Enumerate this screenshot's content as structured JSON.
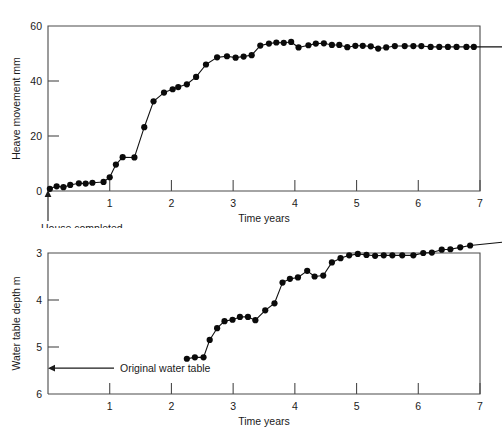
{
  "figure": {
    "background": "#ffffff",
    "line_color": "#111111",
    "marker_color": "#0a0a0a",
    "axis_color": "#4a4a4a"
  },
  "chart_data": [
    {
      "type": "line",
      "id": "heave-movement",
      "title": "",
      "xlabel": "Time years",
      "ylabel": "Heave movement mm",
      "xlim": [
        0,
        7
      ],
      "ylim": [
        0,
        60
      ],
      "xticks": [
        0,
        1,
        2,
        3,
        4,
        5,
        6,
        7
      ],
      "xtick_labels": [
        "",
        "1",
        "2",
        "3",
        "4",
        "5",
        "6",
        "7"
      ],
      "yticks": [
        0,
        20,
        40,
        60
      ],
      "ytick_labels": [
        "0",
        "20",
        "40",
        "60"
      ],
      "grid": false,
      "legend": "none",
      "markers": true,
      "annotations": [
        {
          "text": "House completed",
          "x": 0,
          "y": 0,
          "arrow": "up"
        }
      ],
      "x": [
        0.03,
        0.14,
        0.25,
        0.36,
        0.5,
        0.61,
        0.72,
        0.9,
        1.0,
        1.1,
        1.21,
        1.4,
        1.56,
        1.71,
        1.88,
        2.02,
        2.11,
        2.25,
        2.4,
        2.56,
        2.74,
        2.9,
        3.04,
        3.17,
        3.3,
        3.44,
        3.58,
        3.7,
        3.82,
        3.94,
        4.06,
        4.22,
        4.34,
        4.47,
        4.6,
        4.72,
        4.85,
        4.98,
        5.1,
        5.23,
        5.35,
        5.48,
        5.62,
        5.78,
        5.92,
        6.05,
        6.2,
        6.34,
        6.48,
        6.62,
        6.78,
        6.9
      ],
      "y": [
        0.8,
        1.7,
        1.4,
        2.2,
        2.8,
        2.7,
        3.0,
        3.3,
        5.0,
        9.6,
        12.3,
        12.2,
        23.2,
        32.6,
        35.8,
        37.0,
        37.8,
        38.8,
        41.5,
        46.0,
        48.6,
        49.0,
        48.5,
        48.9,
        49.4,
        52.9,
        53.6,
        54.0,
        53.9,
        54.2,
        52.2,
        53.0,
        53.6,
        53.7,
        53.1,
        53.1,
        52.3,
        52.8,
        52.8,
        52.6,
        51.8,
        52.2,
        52.7,
        52.7,
        52.7,
        52.7,
        52.4,
        52.4,
        52.4,
        52.4,
        52.4,
        52.4
      ],
      "values": [
        0.8,
        1.7,
        1.4,
        2.2,
        2.8,
        2.7,
        3.0,
        3.3,
        5.0,
        9.6,
        12.3,
        12.2,
        23.2,
        32.6,
        35.8,
        37.0,
        37.8,
        38.8,
        41.5,
        46.0,
        48.6,
        49.0,
        48.5,
        48.9,
        49.4,
        52.9,
        53.6,
        54.0,
        53.9,
        54.2,
        52.2,
        53.0,
        53.6,
        53.7,
        53.1,
        53.1,
        52.3,
        52.8,
        52.8,
        52.6,
        51.8,
        52.2,
        52.7,
        52.7,
        52.7,
        52.7,
        52.4,
        52.4,
        52.4,
        52.4,
        52.4,
        52.4
      ]
    },
    {
      "type": "line",
      "id": "water-table-depth",
      "title": "",
      "xlabel": "Time years",
      "ylabel": "Water table depth m",
      "xlim": [
        0,
        7
      ],
      "ylim": [
        3,
        6
      ],
      "y_inverted": true,
      "xticks": [
        0,
        1,
        2,
        3,
        4,
        5,
        6,
        7
      ],
      "xtick_labels": [
        "",
        "1",
        "2",
        "3",
        "4",
        "5",
        "6",
        "7"
      ],
      "yticks": [
        3,
        4,
        5,
        6
      ],
      "ytick_labels": [
        "3",
        "4",
        "5",
        "6"
      ],
      "grid": false,
      "legend": "none",
      "markers": true,
      "annotations": [
        {
          "text": "Original water table",
          "x": 0,
          "y": 5.45,
          "arrow": "left"
        }
      ],
      "x": [
        2.25,
        2.38,
        2.52,
        2.62,
        2.74,
        2.86,
        2.99,
        3.11,
        3.24,
        3.36,
        3.52,
        3.67,
        3.8,
        3.92,
        4.05,
        4.2,
        4.32,
        4.46,
        4.6,
        4.74,
        4.88,
        5.02,
        5.16,
        5.3,
        5.44,
        5.58,
        5.74,
        5.92,
        6.08,
        6.22,
        6.38,
        6.52,
        6.68,
        6.84
      ],
      "y": [
        5.25,
        5.22,
        5.22,
        4.85,
        4.6,
        4.45,
        4.42,
        4.36,
        4.36,
        4.43,
        4.22,
        4.07,
        3.63,
        3.55,
        3.52,
        3.38,
        3.5,
        3.48,
        3.2,
        3.11,
        3.05,
        3.02,
        3.04,
        3.06,
        3.05,
        3.05,
        3.05,
        3.05,
        3.0,
        2.99,
        2.93,
        2.92,
        2.88,
        2.84
      ],
      "values": [
        5.25,
        5.22,
        5.22,
        4.85,
        4.6,
        4.45,
        4.42,
        4.36,
        4.36,
        4.43,
        4.22,
        4.07,
        3.63,
        3.55,
        3.52,
        3.38,
        3.5,
        3.48,
        3.2,
        3.11,
        3.05,
        3.02,
        3.04,
        3.06,
        3.05,
        3.05,
        3.05,
        3.05,
        3.0,
        2.99,
        2.93,
        2.92,
        2.88,
        2.84
      ]
    }
  ]
}
